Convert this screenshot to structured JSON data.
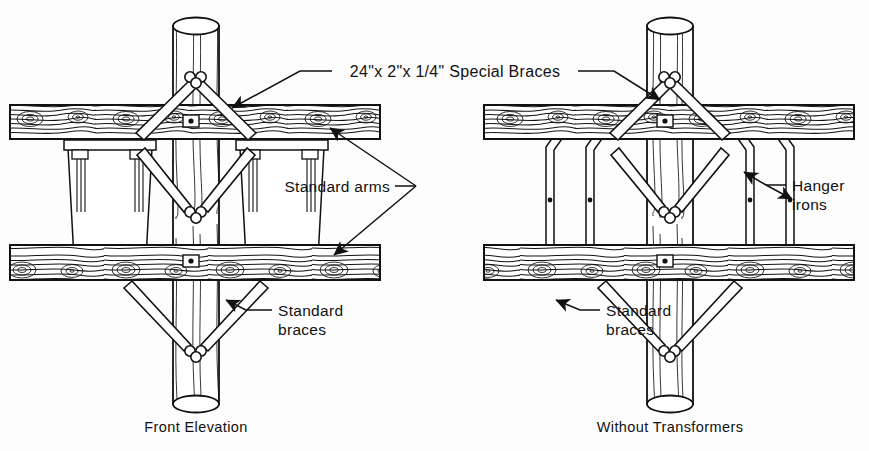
{
  "figure": {
    "title_label": "24\"x 2\"x 1/4\" Special Braces",
    "background_color": "#fdfdfd",
    "ink_color": "#111111"
  },
  "labels": {
    "special_braces": "24\"x 2\"x 1/4\" Special Braces",
    "standard_arms": "Standard arms",
    "hanger_irons_line1": "Hanger",
    "hanger_irons_line2": "irons",
    "standard_braces_left_line1": "Standard",
    "standard_braces_left_line2": "braces",
    "standard_braces_right_line1": "Standard",
    "standard_braces_right_line2": "braces"
  },
  "captions": {
    "left": "Front Elevation",
    "right": "Without Transformers"
  },
  "views": [
    {
      "id": "front-elevation",
      "caption": "Front Elevation",
      "has_transformers": true,
      "pole_center_x": 196,
      "components": [
        "pole",
        "upper-crossarm",
        "lower-crossarm",
        "special-braces",
        "standard-braces",
        "transformer-tanks"
      ],
      "transformer_count": 2
    },
    {
      "id": "without-transformers",
      "caption": "Without Transformers",
      "has_transformers": false,
      "pole_center_x": 670,
      "components": [
        "pole",
        "upper-crossarm",
        "lower-crossarm",
        "special-braces",
        "standard-braces",
        "hanger-irons"
      ],
      "hanger_iron_count": 4
    }
  ]
}
